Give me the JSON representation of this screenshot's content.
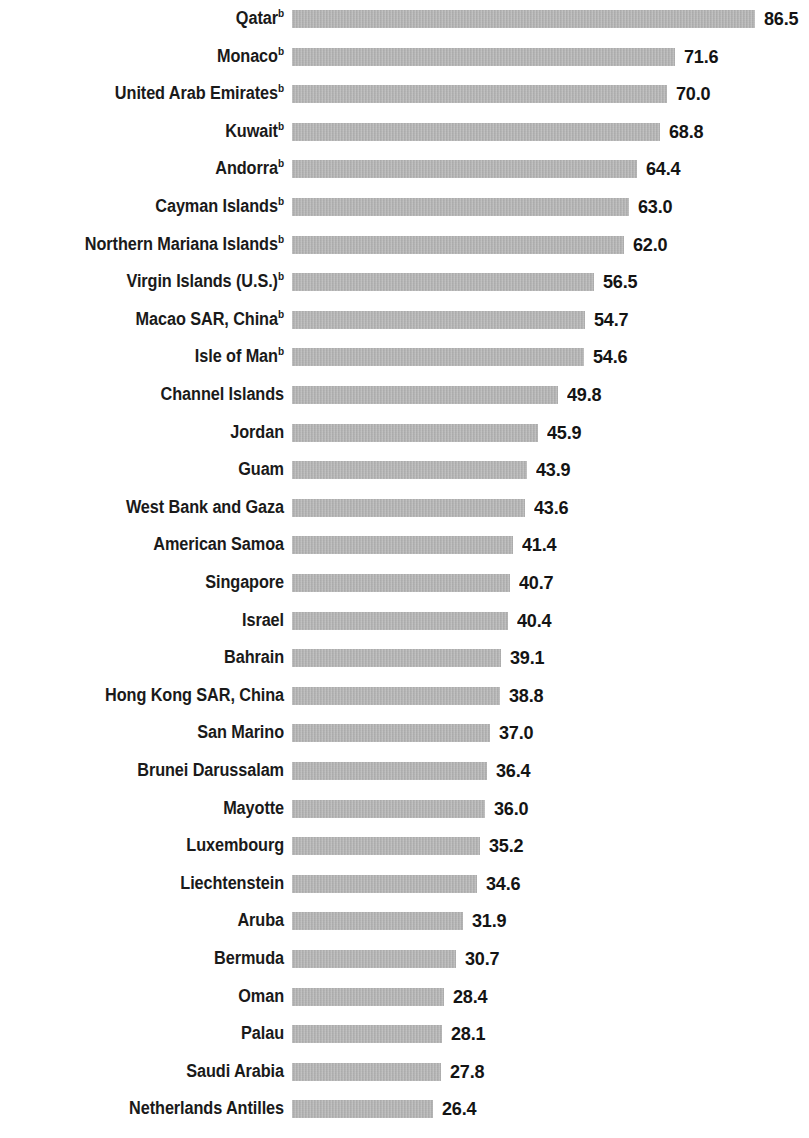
{
  "chart_data": {
    "type": "bar",
    "orientation": "horizontal",
    "title": "",
    "subtitle": "",
    "xlabel": "",
    "ylabel": "",
    "grid": false,
    "legend": null,
    "axis_visible": false,
    "xlim": [
      0,
      86.5
    ],
    "bar_color": "#b2b2b2",
    "text_color": "#1a1a1a",
    "value_format": "one-decimal",
    "footnote_marker": "b",
    "sorted": "descending",
    "categories": [
      "Qatar",
      "Monaco",
      "United Arab Emirates",
      "Kuwait",
      "Andorra",
      "Cayman Islands",
      "Northern Mariana Islands",
      "Virgin Islands (U.S.)",
      "Macao SAR, China",
      "Isle of Man",
      "Channel Islands",
      "Jordan",
      "Guam",
      "West Bank and Gaza",
      "American Samoa",
      "Singapore",
      "Israel",
      "Bahrain",
      "Hong Kong SAR, China",
      "San Marino",
      "Brunei Darussalam",
      "Mayotte",
      "Luxembourg",
      "Liechtenstein",
      "Aruba",
      "Bermuda",
      "Oman",
      "Palau",
      "Saudi Arabia",
      "Netherlands Antilles"
    ],
    "values": [
      86.5,
      71.6,
      70.0,
      68.8,
      64.4,
      63.0,
      62.0,
      56.5,
      54.7,
      54.6,
      49.8,
      45.9,
      43.9,
      43.6,
      41.4,
      40.7,
      40.4,
      39.1,
      38.8,
      37.0,
      36.4,
      36.0,
      35.2,
      34.6,
      31.9,
      30.7,
      28.4,
      28.1,
      27.8,
      26.4
    ],
    "rows": [
      {
        "label": "Qatar",
        "marker": "b",
        "value": 86.5,
        "value_text": "86.5"
      },
      {
        "label": "Monaco",
        "marker": "b",
        "value": 71.6,
        "value_text": "71.6"
      },
      {
        "label": "United Arab Emirates",
        "marker": "b",
        "value": 70.0,
        "value_text": "70.0"
      },
      {
        "label": "Kuwait",
        "marker": "b",
        "value": 68.8,
        "value_text": "68.8"
      },
      {
        "label": "Andorra",
        "marker": "b",
        "value": 64.4,
        "value_text": "64.4"
      },
      {
        "label": "Cayman Islands",
        "marker": "b",
        "value": 63.0,
        "value_text": "63.0"
      },
      {
        "label": "Northern Mariana Islands",
        "marker": "b",
        "value": 62.0,
        "value_text": "62.0"
      },
      {
        "label": "Virgin Islands (U.S.)",
        "marker": "b",
        "value": 56.5,
        "value_text": "56.5"
      },
      {
        "label": "Macao SAR, China",
        "marker": "b",
        "value": 54.7,
        "value_text": "54.7"
      },
      {
        "label": "Isle of Man",
        "marker": "b",
        "value": 54.6,
        "value_text": "54.6"
      },
      {
        "label": "Channel Islands",
        "marker": "",
        "value": 49.8,
        "value_text": "49.8"
      },
      {
        "label": "Jordan",
        "marker": "",
        "value": 45.9,
        "value_text": "45.9"
      },
      {
        "label": "Guam",
        "marker": "",
        "value": 43.9,
        "value_text": "43.9"
      },
      {
        "label": "West Bank and Gaza",
        "marker": "",
        "value": 43.6,
        "value_text": "43.6"
      },
      {
        "label": "American Samoa",
        "marker": "",
        "value": 41.4,
        "value_text": "41.4"
      },
      {
        "label": "Singapore",
        "marker": "",
        "value": 40.7,
        "value_text": "40.7"
      },
      {
        "label": "Israel",
        "marker": "",
        "value": 40.4,
        "value_text": "40.4"
      },
      {
        "label": "Bahrain",
        "marker": "",
        "value": 39.1,
        "value_text": "39.1"
      },
      {
        "label": "Hong Kong SAR, China",
        "marker": "",
        "value": 38.8,
        "value_text": "38.8"
      },
      {
        "label": "San Marino",
        "marker": "",
        "value": 37.0,
        "value_text": "37.0"
      },
      {
        "label": "Brunei Darussalam",
        "marker": "",
        "value": 36.4,
        "value_text": "36.4"
      },
      {
        "label": "Mayotte",
        "marker": "",
        "value": 36.0,
        "value_text": "36.0"
      },
      {
        "label": "Luxembourg",
        "marker": "",
        "value": 35.2,
        "value_text": "35.2"
      },
      {
        "label": "Liechtenstein",
        "marker": "",
        "value": 34.6,
        "value_text": "34.6"
      },
      {
        "label": "Aruba",
        "marker": "",
        "value": 31.9,
        "value_text": "31.9"
      },
      {
        "label": "Bermuda",
        "marker": "",
        "value": 30.7,
        "value_text": "30.7"
      },
      {
        "label": "Oman",
        "marker": "",
        "value": 28.4,
        "value_text": "28.4"
      },
      {
        "label": "Palau",
        "marker": "",
        "value": 28.1,
        "value_text": "28.1"
      },
      {
        "label": "Saudi Arabia",
        "marker": "",
        "value": 27.8,
        "value_text": "27.8"
      },
      {
        "label": "Netherlands Antilles",
        "marker": "",
        "value": 26.4,
        "value_text": "26.4"
      }
    ]
  },
  "layout": {
    "bar_origin_x": 292,
    "px_per_unit": 5.35,
    "row_pitch": 37.6,
    "row_top_offset": 0,
    "bar_height": 18,
    "label_right_edge": 284,
    "value_gap": 9
  }
}
